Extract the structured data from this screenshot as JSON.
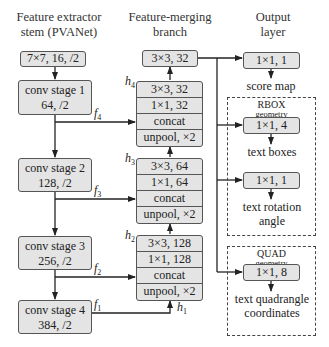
{
  "columns": {
    "stem": {
      "title_line1": "Feature extractor",
      "title_line2": "stem (PVANet)"
    },
    "merge": {
      "title_line1": "Feature-merging",
      "title_line2": "branch"
    },
    "output": {
      "title_line1": "Output",
      "title_line2": "layer"
    }
  },
  "stem": {
    "input_conv": "7×7, 16, /2",
    "stages": [
      {
        "name": "conv stage 1",
        "params": "64, /2",
        "feature": "f",
        "feature_sub": "4"
      },
      {
        "name": "conv stage 2",
        "params": "128, /2",
        "feature": "f",
        "feature_sub": "3"
      },
      {
        "name": "conv stage 3",
        "params": "256, /2",
        "feature": "f",
        "feature_sub": "2"
      },
      {
        "name": "conv stage 4",
        "params": "384, /2",
        "feature": "f",
        "feature_sub": "1"
      }
    ]
  },
  "merge": {
    "top_conv": "3×3, 32",
    "h1_label": {
      "base": "h",
      "sub": "1"
    },
    "blocks": [
      {
        "label": "h",
        "label_sub": "4",
        "rows": [
          "3×3, 32",
          "1×1, 32",
          "concat",
          "unpool, ×2"
        ]
      },
      {
        "label": "h",
        "label_sub": "3",
        "rows": [
          "3×3, 64",
          "1×1, 64",
          "concat",
          "unpool, ×2"
        ]
      },
      {
        "label": "h",
        "label_sub": "2",
        "rows": [
          "3×3, 128",
          "1×1, 128",
          "concat",
          "unpool, ×2"
        ]
      }
    ]
  },
  "output": {
    "score_conv": "1×1, 1",
    "score_label": "score map",
    "rbox": {
      "title": "RBOX",
      "subtitle": "geometry",
      "boxes_conv": "1×1, 4",
      "boxes_label": "text boxes",
      "angle_conv": "1×1, 1",
      "angle_label_line1": "text rotation",
      "angle_label_line2": "angle"
    },
    "quad": {
      "title": "QUAD",
      "subtitle": "geometry",
      "conv": "1×1, 8",
      "label_line1": "text quadrangle",
      "label_line2": "coordinates"
    }
  }
}
